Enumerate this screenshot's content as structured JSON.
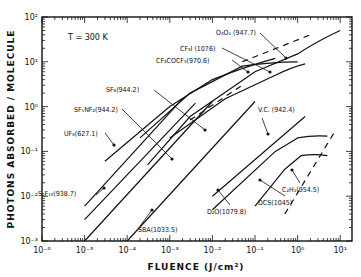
{
  "chart_data": {
    "type": "line",
    "title": "",
    "annotation": "T = 300 K",
    "xlabel": "FLUENCE (J/cm²)",
    "ylabel": "PHOTONS ABSORBED / MOLECULE",
    "xscale": "log",
    "yscale": "log",
    "xlim": [
      1e-06,
      20
    ],
    "ylim": [
      0.001,
      100
    ],
    "x_ticks": [
      "10⁻⁶",
      "10⁻⁵",
      "10⁻⁴",
      "10⁻³",
      "10⁻²",
      "10⁻¹",
      "10⁰",
      "10¹"
    ],
    "y_ticks": [
      "10⁻³",
      "10⁻²",
      "10⁻¹",
      "10⁰",
      "10¹",
      "10²"
    ],
    "grid": false,
    "legend": "inline labels with leader arrows",
    "series": [
      {
        "name": "S2F10 (938.7)",
        "label": "S₂F₁₀(938.7)",
        "style": "solid",
        "points": [
          [
            1e-05,
            0.006
          ],
          [
            0.002,
            1.5
          ]
        ]
      },
      {
        "name": "UF6 (627.1)",
        "label": "UF₆(627.1)",
        "style": "solid",
        "points": [
          [
            1e-05,
            0.003
          ],
          [
            0.004,
            1.2
          ]
        ]
      },
      {
        "name": "SF5NF2 (944.2)",
        "label": "SF₅NF₂(944.2)",
        "style": "solid",
        "points": [
          [
            1e-05,
            0.001
          ],
          [
            0.01,
            1.3
          ]
        ]
      },
      {
        "name": "SBA (1033.5)",
        "label": "SBA(1033.5)",
        "style": "solid",
        "points": [
          [
            0.0001,
            0.001
          ],
          [
            0.1,
            1.3
          ]
        ]
      },
      {
        "name": "SF6 (944.2)",
        "label": "SF₆(944.2)",
        "style": "solid",
        "points": [
          [
            3e-05,
            0.06
          ],
          [
            0.001,
            1.0
          ],
          [
            0.01,
            4
          ],
          [
            0.3,
            12
          ]
        ]
      },
      {
        "name": "SF6 (944.2) dashed",
        "label": "",
        "style": "dashed",
        "points": [
          [
            0.003,
            0.5
          ],
          [
            0.05,
            3
          ]
        ]
      },
      {
        "name": "CF3COCF3 (970.6)",
        "label": "CF₃COCF₃(970.6)",
        "style": "solid",
        "points": [
          [
            0.0002,
            0.2
          ],
          [
            0.003,
            2
          ],
          [
            0.05,
            8
          ],
          [
            1,
            10
          ]
        ]
      },
      {
        "name": "CF3I (1076)",
        "label": "CF₃I (1076)",
        "style": "solid",
        "points": [
          [
            0.001,
            0.2
          ],
          [
            0.02,
            1.5
          ],
          [
            0.3,
            5
          ],
          [
            1.5,
            9
          ]
        ]
      },
      {
        "name": "OsO4 (947.7)",
        "label": "O₃O₄ (947.7)",
        "style": "solid",
        "points": [
          [
            0.0003,
            0.05
          ],
          [
            0.003,
            0.6
          ],
          [
            0.1,
            6
          ],
          [
            1,
            15
          ],
          [
            10,
            50
          ]
        ]
      },
      {
        "name": "OsO4 dashed",
        "label": "",
        "style": "dashed",
        "points": [
          [
            0.05,
            10
          ],
          [
            2,
            40
          ]
        ]
      },
      {
        "name": "V.C. (942.4)",
        "label": "V.C. (942.4)",
        "style": "solid",
        "points": [
          [
            0.01,
            0.01
          ],
          [
            1.5,
            0.6
          ]
        ]
      },
      {
        "name": "D2O (1079.8)",
        "label": "D₂O(1079.8)",
        "style": "solid",
        "points": [
          [
            0.01,
            0.005
          ],
          [
            0.3,
            0.1
          ],
          [
            1,
            0.2
          ],
          [
            5,
            0.22
          ]
        ]
      },
      {
        "name": "DCS (1045)",
        "label": "DCS(1045)",
        "style": "solid",
        "points": [
          [
            0.1,
            0.006
          ],
          [
            0.5,
            0.04
          ],
          [
            1.2,
            0.08
          ],
          [
            5,
            0.08
          ]
        ]
      },
      {
        "name": "C2H4 (954.5)",
        "label": "C₂H₄(954.5)",
        "style": "dashed",
        "points": [
          [
            0.5,
            0.004
          ],
          [
            7,
            0.25
          ]
        ]
      }
    ]
  }
}
